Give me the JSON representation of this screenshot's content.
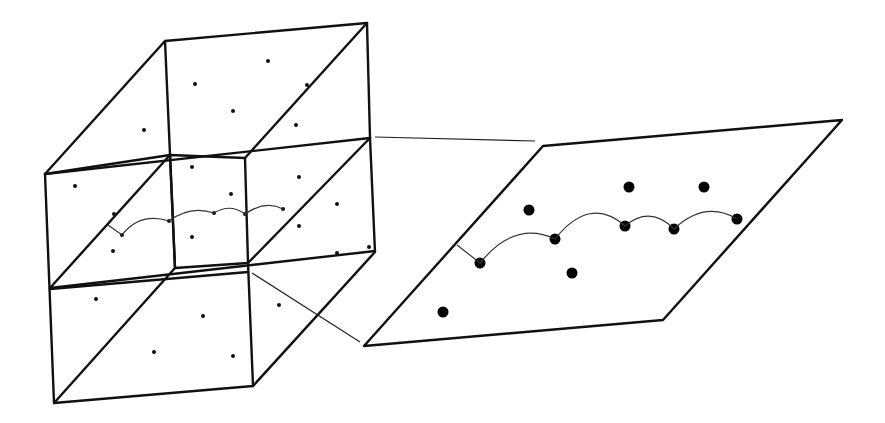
{
  "diagram": {
    "colors": {
      "stroke": "#111111",
      "background": "#ffffff"
    },
    "cube": {
      "small_points": [
        [
          268,
          61
        ],
        [
          195,
          84
        ],
        [
          233,
          111
        ],
        [
          144,
          130
        ],
        [
          296,
          125
        ],
        [
          307,
          85
        ],
        [
          75,
          186
        ],
        [
          192,
          167
        ],
        [
          299,
          177
        ],
        [
          231,
          194
        ],
        [
          337,
          204
        ],
        [
          114,
          214
        ],
        [
          299,
          226
        ],
        [
          369,
          247
        ],
        [
          113,
          251
        ],
        [
          337,
          253
        ],
        [
          192,
          237
        ],
        [
          338,
          197
        ],
        [
          96,
          299
        ],
        [
          203,
          316
        ],
        [
          279,
          305
        ],
        [
          154,
          352
        ],
        [
          233,
          356
        ]
      ],
      "trajectory": [
        [
          108,
          225
        ],
        [
          122,
          235
        ],
        [
          169,
          221
        ],
        [
          214,
          213
        ],
        [
          245,
          214
        ],
        [
          283,
          209
        ]
      ]
    },
    "plane": {
      "corners": [
        [
          543,
          146
        ],
        [
          842,
          120
        ],
        [
          663,
          320
        ],
        [
          364,
          346
        ]
      ],
      "points": [
        [
          529,
          210
        ],
        [
          629,
          187
        ],
        [
          704,
          187
        ],
        [
          572,
          273
        ],
        [
          443,
          312
        ]
      ],
      "trajectory": [
        [
          457,
          245
        ],
        [
          480,
          263
        ],
        [
          555,
          239
        ],
        [
          625,
          226
        ],
        [
          674,
          229
        ],
        [
          737,
          219
        ]
      ]
    }
  }
}
